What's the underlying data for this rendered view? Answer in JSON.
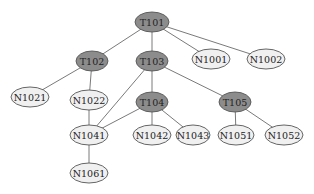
{
  "diagram": {
    "type": "tree",
    "colors": {
      "internal_fill": "#8c8c8c",
      "leaf_fill": "#f0f0f0",
      "edge": "#7a7a7a",
      "outline": "#555555",
      "text": "#222222"
    },
    "nodes": [
      {
        "id": "T101",
        "label": "T101",
        "kind": "internal",
        "x": 152,
        "y": 22,
        "rx": 17,
        "ry": 10
      },
      {
        "id": "T102",
        "label": "T102",
        "kind": "internal",
        "x": 92,
        "y": 61,
        "rx": 16,
        "ry": 10
      },
      {
        "id": "T103",
        "label": "T103",
        "kind": "internal",
        "x": 152,
        "y": 61,
        "rx": 16,
        "ry": 10
      },
      {
        "id": "N1001",
        "label": "N1001",
        "kind": "leaf",
        "x": 211,
        "y": 59,
        "rx": 19,
        "ry": 10
      },
      {
        "id": "N1002",
        "label": "N1002",
        "kind": "leaf",
        "x": 266,
        "y": 59,
        "rx": 19,
        "ry": 10
      },
      {
        "id": "N1021",
        "label": "N1021",
        "kind": "leaf",
        "x": 30,
        "y": 97,
        "rx": 19,
        "ry": 10
      },
      {
        "id": "N1022",
        "label": "N1022",
        "kind": "leaf",
        "x": 89,
        "y": 100,
        "rx": 19,
        "ry": 10
      },
      {
        "id": "T104",
        "label": "T104",
        "kind": "internal",
        "x": 152,
        "y": 102,
        "rx": 16,
        "ry": 10
      },
      {
        "id": "T105",
        "label": "T105",
        "kind": "internal",
        "x": 235,
        "y": 102,
        "rx": 16,
        "ry": 10
      },
      {
        "id": "N1041",
        "label": "N1041",
        "kind": "leaf",
        "x": 89,
        "y": 135,
        "rx": 19,
        "ry": 10
      },
      {
        "id": "N1042",
        "label": "N1042",
        "kind": "leaf",
        "x": 152,
        "y": 135,
        "rx": 19,
        "ry": 10
      },
      {
        "id": "N1043",
        "label": "N1043",
        "kind": "leaf",
        "x": 193,
        "y": 135,
        "rx": 17,
        "ry": 10
      },
      {
        "id": "N1051",
        "label": "N1051",
        "kind": "leaf",
        "x": 236,
        "y": 135,
        "rx": 18,
        "ry": 10
      },
      {
        "id": "N1052",
        "label": "N1052",
        "kind": "leaf",
        "x": 284,
        "y": 135,
        "rx": 19,
        "ry": 10
      },
      {
        "id": "N1061",
        "label": "N1061",
        "kind": "leaf",
        "x": 89,
        "y": 173,
        "rx": 19,
        "ry": 10
      }
    ],
    "edges": [
      {
        "from": "T101",
        "to": "T102"
      },
      {
        "from": "T101",
        "to": "T103"
      },
      {
        "from": "T101",
        "to": "N1001"
      },
      {
        "from": "T101",
        "to": "N1002"
      },
      {
        "from": "T102",
        "to": "N1021"
      },
      {
        "from": "T102",
        "to": "N1022"
      },
      {
        "from": "T103",
        "to": "T104"
      },
      {
        "from": "T103",
        "to": "T105"
      },
      {
        "from": "T103",
        "to": "N1041"
      },
      {
        "from": "N1022",
        "to": "N1041"
      },
      {
        "from": "T104",
        "to": "N1041"
      },
      {
        "from": "T104",
        "to": "N1042"
      },
      {
        "from": "T104",
        "to": "N1043"
      },
      {
        "from": "T105",
        "to": "N1051"
      },
      {
        "from": "T105",
        "to": "N1052"
      },
      {
        "from": "N1041",
        "to": "N1061"
      }
    ]
  }
}
